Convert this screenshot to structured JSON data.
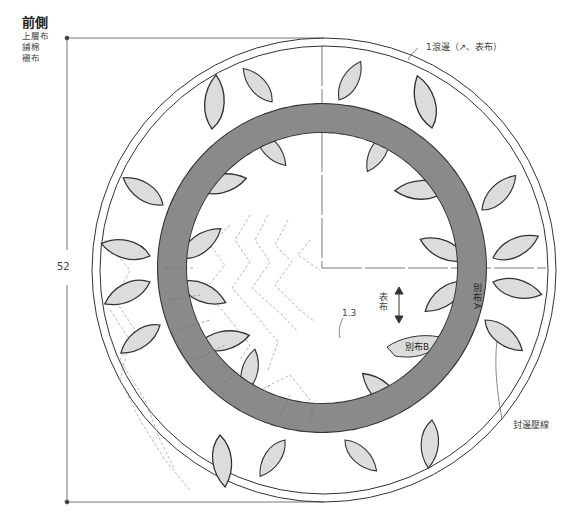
{
  "header": {
    "title": "前側",
    "layers": [
      "上層布",
      "鋪棉",
      "襯布"
    ]
  },
  "dimensions": {
    "height_label": "52",
    "quilt_spacing_label": "1.3"
  },
  "annotations": {
    "binding": "1滾邊（↗、表布）",
    "grain_label": "表布",
    "fabric_a": "別布A",
    "fabric_b": "別布B",
    "edge_quilting": "封邊壓線"
  },
  "colors": {
    "ring_fill": "#8a8a8a",
    "leaf_fill": "#dcdcdc",
    "outline": "#333333",
    "quilt_line": "#9a9a9a"
  }
}
